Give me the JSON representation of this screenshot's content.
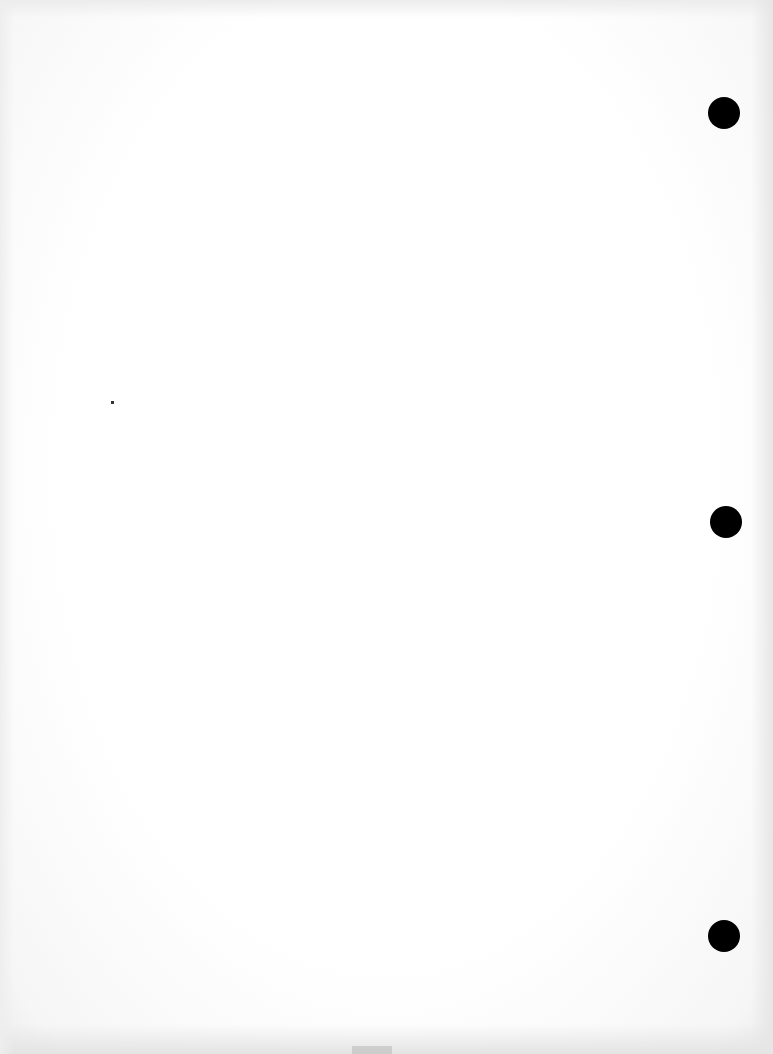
{
  "document": {
    "description": "Blank scanned sheet of paper with three punched binder holes",
    "text_content": "",
    "colors": {
      "paper": "#ffffff",
      "hole": "#000000",
      "edge_shadow": "#e6e6e6"
    },
    "holes": [
      {
        "name": "top",
        "cx": 724,
        "cy": 113
      },
      {
        "name": "middle",
        "cx": 726,
        "cy": 522
      },
      {
        "name": "bottom",
        "cx": 724,
        "cy": 936
      }
    ],
    "marks": [
      {
        "name": "speck",
        "x": 112,
        "y": 402
      }
    ]
  }
}
